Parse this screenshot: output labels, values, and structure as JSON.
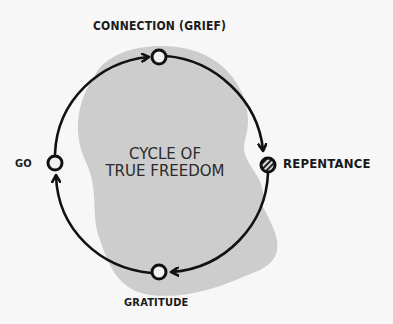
{
  "diagram": {
    "title": "CYCLE OF TRUE FREEDOM",
    "title_lines": [
      "CYCLE OF",
      "TRUE FREEDOM"
    ],
    "nodes": [
      {
        "label": "CONNECTION (GRIEF)",
        "position": "top",
        "style": "hollow"
      },
      {
        "label": "REPENTANCE",
        "position": "right",
        "style": "hatched"
      },
      {
        "label": "GRATITUDE",
        "position": "bottom",
        "style": "hollow"
      },
      {
        "label": "GO",
        "position": "left",
        "style": "hollow"
      }
    ],
    "flow": "clockwise",
    "colors": {
      "background": "#f7f7f7",
      "blob": "#cdcdcd",
      "stroke": "#111111"
    }
  }
}
